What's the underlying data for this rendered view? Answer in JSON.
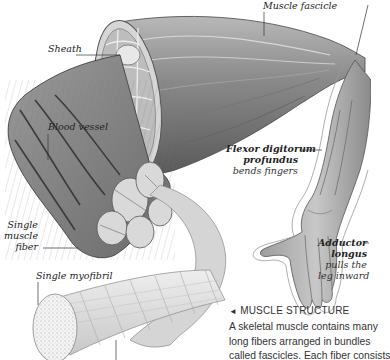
{
  "labels": {
    "muscle_fascicle": "Muscle fascicle",
    "sheath": "Sheath",
    "blood_vessel": "Blood vessel",
    "single_muscle_fiber": [
      "Single",
      "muscle",
      "fiber"
    ],
    "single_myofibril": "Single myofibril",
    "flexor": {
      "name_line1": "Flexor digitorum",
      "name_line2": "profundus",
      "desc": "bends fingers"
    },
    "adductor": {
      "name_line1": "Adductor",
      "name_line2": "longus",
      "desc_line1": "pulls the",
      "desc_line2": "leg inward"
    }
  },
  "caption": {
    "arrow": "◄",
    "title": "MUSCLE STRUCTURE",
    "lines": [
      "A skeletal muscle contains many",
      "long fibers arranged in bundles",
      "called fascicles. Each fiber consists"
    ]
  },
  "colors": {
    "ink": "#222222",
    "muscle_dark": "#555555",
    "muscle_light": "#cfcfcf",
    "background": "#ffffff"
  }
}
